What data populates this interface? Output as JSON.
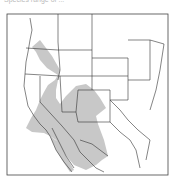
{
  "caption": "Species range of ...",
  "map": {
    "region": "Western and central United States and northern Mexico",
    "range_description": "Shaded distribution range",
    "colors": {
      "range_fill": "#c8c8c8",
      "boundary": "#333333",
      "background": "#ffffff",
      "frame": "#444444"
    }
  }
}
